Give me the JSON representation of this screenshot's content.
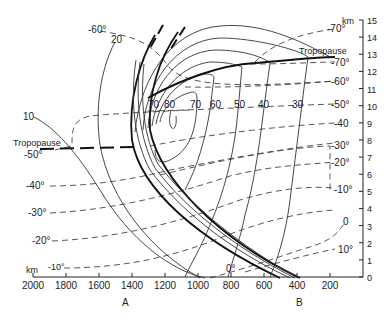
{
  "diagram": {
    "type": "cross-section",
    "x_axis": {
      "unit_label": "km",
      "ticks": [
        "2000",
        "1800",
        "1600",
        "1400",
        "1200",
        "1000",
        "800",
        "600",
        "400",
        "200"
      ],
      "endpoint_labels": [
        "A",
        "B"
      ]
    },
    "y_axis": {
      "unit_label": "km",
      "ticks": [
        "0",
        "1",
        "2",
        "3",
        "4",
        "5",
        "6",
        "7",
        "8",
        "9",
        "10",
        "11",
        "12",
        "13",
        "14",
        "15"
      ]
    },
    "tropopause_labels": [
      "Tropopause",
      "Tropopause"
    ],
    "isotach_labels": {
      "left": [
        "20",
        "10"
      ],
      "core": [
        "70",
        "80",
        "70",
        "60",
        "50",
        "40",
        "30"
      ]
    },
    "isotherm_labels": {
      "left": [
        "-60°",
        "-50°",
        "-40°",
        "-30°",
        "-20°",
        "-10°"
      ],
      "right": [
        "-70°",
        "-70°",
        "-60°",
        "-50°",
        "-40",
        "-30°",
        "-20°",
        "-10°",
        "0",
        "10°"
      ],
      "bottom": "0°"
    }
  }
}
